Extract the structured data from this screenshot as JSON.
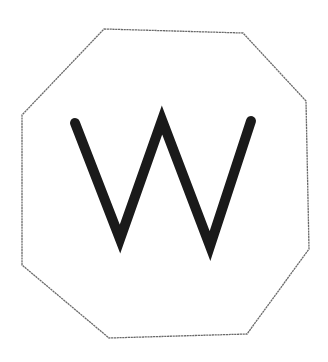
{
  "figure": {
    "shape": "octagon",
    "letter": "W",
    "outline_color": "#6a6a6a",
    "letter_color": "#1a1a1a",
    "background_color": "#ffffff"
  }
}
